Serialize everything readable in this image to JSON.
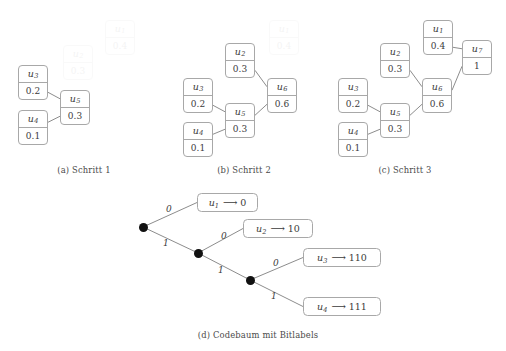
{
  "figure": {
    "panels": [
      {
        "id": "a",
        "caption": "(a) Schritt 1",
        "nodes": [
          {
            "name": "u1",
            "symbol": "u",
            "index": "1",
            "weight": "0.4",
            "ghost": true,
            "x": 105,
            "y": 20
          },
          {
            "name": "u2",
            "symbol": "u",
            "index": "2",
            "weight": "0.3",
            "ghost": true,
            "x": 63,
            "y": 45
          },
          {
            "name": "u3",
            "symbol": "u",
            "index": "3",
            "weight": "0.2",
            "ghost": false,
            "x": 18,
            "y": 65
          },
          {
            "name": "u5",
            "symbol": "u",
            "index": "5",
            "weight": "0.3",
            "ghost": false,
            "x": 60,
            "y": 90
          },
          {
            "name": "u4",
            "symbol": "u",
            "index": "4",
            "weight": "0.1",
            "ghost": false,
            "x": 18,
            "y": 110
          }
        ],
        "edges": [
          {
            "from": "u3",
            "to": "u5"
          },
          {
            "from": "u4",
            "to": "u5"
          }
        ]
      },
      {
        "id": "b",
        "caption": "(b) Schritt 2",
        "nodes": [
          {
            "name": "u1",
            "symbol": "u",
            "index": "1",
            "weight": "0.4",
            "ghost": true,
            "x": 269,
            "y": 20
          },
          {
            "name": "u2",
            "symbol": "u",
            "index": "2",
            "weight": "0.3",
            "ghost": false,
            "x": 225,
            "y": 43
          },
          {
            "name": "u3",
            "symbol": "u",
            "index": "3",
            "weight": "0.2",
            "ghost": false,
            "x": 183,
            "y": 78
          },
          {
            "name": "u6",
            "symbol": "u",
            "index": "6",
            "weight": "0.6",
            "ghost": false,
            "x": 267,
            "y": 78
          },
          {
            "name": "u5",
            "symbol": "u",
            "index": "5",
            "weight": "0.3",
            "ghost": false,
            "x": 225,
            "y": 103
          },
          {
            "name": "u4",
            "symbol": "u",
            "index": "4",
            "weight": "0.1",
            "ghost": false,
            "x": 183,
            "y": 122
          }
        ],
        "edges": [
          {
            "from": "u3",
            "to": "u5"
          },
          {
            "from": "u4",
            "to": "u5"
          },
          {
            "from": "u2",
            "to": "u6"
          },
          {
            "from": "u5",
            "to": "u6"
          }
        ]
      },
      {
        "id": "c",
        "caption": "(c) Schritt 3",
        "nodes": [
          {
            "name": "u1",
            "symbol": "u",
            "index": "1",
            "weight": "0.4",
            "ghost": false,
            "x": 423,
            "y": 20
          },
          {
            "name": "u7",
            "symbol": "u",
            "index": "7",
            "weight": "1",
            "ghost": false,
            "x": 462,
            "y": 40
          },
          {
            "name": "u2",
            "symbol": "u",
            "index": "2",
            "weight": "0.3",
            "ghost": false,
            "x": 380,
            "y": 43
          },
          {
            "name": "u3",
            "symbol": "u",
            "index": "3",
            "weight": "0.2",
            "ghost": false,
            "x": 338,
            "y": 78
          },
          {
            "name": "u6",
            "symbol": "u",
            "index": "6",
            "weight": "0.6",
            "ghost": false,
            "x": 422,
            "y": 78
          },
          {
            "name": "u5",
            "symbol": "u",
            "index": "5",
            "weight": "0.3",
            "ghost": false,
            "x": 380,
            "y": 103
          },
          {
            "name": "u4",
            "symbol": "u",
            "index": "4",
            "weight": "0.1",
            "ghost": false,
            "x": 338,
            "y": 122
          }
        ],
        "edges": [
          {
            "from": "u3",
            "to": "u5"
          },
          {
            "from": "u4",
            "to": "u5"
          },
          {
            "from": "u2",
            "to": "u6"
          },
          {
            "from": "u5",
            "to": "u6"
          },
          {
            "from": "u1",
            "to": "u7"
          },
          {
            "from": "u6",
            "to": "u7"
          }
        ]
      }
    ],
    "code_tree": {
      "caption": "(d) Codebaum mit Bitlabels",
      "nodes": [
        {
          "name": "root",
          "x": 143,
          "y": 227
        },
        {
          "name": "internal1",
          "x": 198,
          "y": 253
        },
        {
          "name": "internal2",
          "x": 250,
          "y": 280
        }
      ],
      "bit_labels": [
        {
          "name": "bit-root-0",
          "text": "0",
          "x": 166,
          "y": 205
        },
        {
          "name": "bit-root-1",
          "text": "1",
          "x": 163,
          "y": 239
        },
        {
          "name": "bit-internal1-0",
          "text": "0",
          "x": 221,
          "y": 232
        },
        {
          "name": "bit-internal1-1",
          "text": "1",
          "x": 218,
          "y": 266
        },
        {
          "name": "bit-internal2-0",
          "text": "0",
          "x": 273,
          "y": 259
        },
        {
          "name": "bit-internal2-1",
          "text": "1",
          "x": 271,
          "y": 292
        }
      ],
      "leaves": [
        {
          "name": "u1",
          "symbol": "u",
          "index": "1",
          "arrow": "⟶",
          "code": "0",
          "x": 197,
          "y": 193,
          "w": 61,
          "h": 19
        },
        {
          "name": "u2",
          "symbol": "u",
          "index": "2",
          "arrow": "⟶",
          "code": "10",
          "x": 243,
          "y": 219,
          "w": 70,
          "h": 19
        },
        {
          "name": "u3",
          "symbol": "u",
          "index": "3",
          "arrow": "⟶",
          "code": "110",
          "x": 303,
          "y": 248,
          "w": 78,
          "h": 19
        },
        {
          "name": "u4",
          "symbol": "u",
          "index": "4",
          "arrow": "⟶",
          "code": "111",
          "x": 303,
          "y": 297,
          "w": 78,
          "h": 19
        }
      ],
      "edges": [
        {
          "from": "root",
          "to_leaf": "u1",
          "bit": "0"
        },
        {
          "from": "root",
          "to_node": "internal1",
          "bit": "1"
        },
        {
          "from": "internal1",
          "to_leaf": "u2",
          "bit": "0"
        },
        {
          "from": "internal1",
          "to_node": "internal2",
          "bit": "1"
        },
        {
          "from": "internal2",
          "to_leaf": "u3",
          "bit": "0"
        },
        {
          "from": "internal2",
          "to_leaf": "u4",
          "bit": "1"
        }
      ]
    },
    "captions": [
      {
        "name": "caption-a",
        "text": "(a) Schritt 1",
        "x": 24,
        "y": 165,
        "w": 120
      },
      {
        "name": "caption-b",
        "text": "(b) Schritt 2",
        "x": 184,
        "y": 165,
        "w": 120
      },
      {
        "name": "caption-c",
        "text": "(c) Schritt 3",
        "x": 345,
        "y": 165,
        "w": 120
      },
      {
        "name": "caption-d",
        "text": "(d) Codebaum mit Bitlabels",
        "x": 182,
        "y": 330,
        "w": 152
      }
    ],
    "style": {
      "box_w": 30,
      "box_h": 35,
      "border_color": "#a8a8a8",
      "edge_color": "#6e6e6e",
      "text_color": "#3b3b3b",
      "dot_color": "#111111",
      "background": "#ffffff"
    }
  }
}
